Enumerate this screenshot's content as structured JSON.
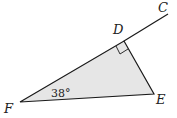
{
  "diagram": {
    "points": {
      "C": {
        "label": "C",
        "x": 168,
        "y": 14
      },
      "D": {
        "label": "D",
        "x": 124,
        "y": 41
      },
      "E": {
        "label": "E",
        "x": 154,
        "y": 94
      },
      "F": {
        "label": "F",
        "x": 20,
        "y": 102
      }
    },
    "angle_label": "38°",
    "right_angle_at": "D",
    "fill_color": "#e6e6e6",
    "stroke_color": "#1a1a1a"
  }
}
